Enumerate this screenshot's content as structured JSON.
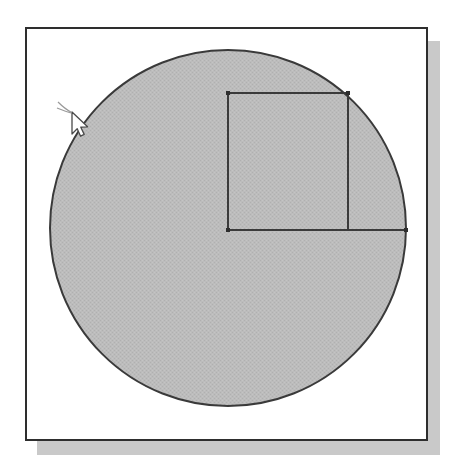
{
  "document": {
    "title": "Circle with inscribed quarter-square figure",
    "background_color": "#ffffff"
  },
  "panel": {
    "name": "framed-drawing-panel",
    "x": 25,
    "y": 27,
    "width": 403,
    "height": 414,
    "fill_color": "#ffffff",
    "border_color": "#2e2e2e",
    "border_width": 2,
    "shadow": {
      "color": "#c9c9c9",
      "offset_x": 12,
      "offset_y": 14,
      "width": 403,
      "height": 414
    }
  },
  "figure": {
    "name": "geometry-diagram",
    "stroke_color": "#3a3a3a",
    "fill_color": "#b9b9b9",
    "stroke_width": 2,
    "circle": {
      "name": "shaded-circle",
      "center_x": 228,
      "center_y": 228,
      "radius": 178,
      "fill": "#b9b9b9",
      "stroke": "#3a3a3a"
    },
    "square": {
      "name": "inscribed-square",
      "top_left_x": 228,
      "top_left_y": 93,
      "top_right_x": 348,
      "top_right_y": 93,
      "bottom_left_x": 228,
      "bottom_left_y": 230,
      "bottom_right_x": 348,
      "bottom_right_y": 230,
      "stroke": "#3a3a3a"
    },
    "radius_line": {
      "name": "horizontal-radius-line",
      "x1": 228,
      "y1": 230,
      "x2": 406,
      "y2": 230,
      "stroke": "#3a3a3a"
    },
    "vertices": [
      {
        "name": "vertex-center",
        "x": 228,
        "y": 230
      },
      {
        "name": "vertex-top-left",
        "x": 228,
        "y": 93
      },
      {
        "name": "vertex-on-circle-top-right",
        "x": 348,
        "y": 93
      },
      {
        "name": "vertex-on-circle-right",
        "x": 406,
        "y": 230
      }
    ]
  },
  "cursor": {
    "name": "mouse-pointer",
    "type": "arrow-pointer",
    "x": 72,
    "y": 112,
    "fill": "#ffffff",
    "stroke": "#4a4a4a"
  }
}
